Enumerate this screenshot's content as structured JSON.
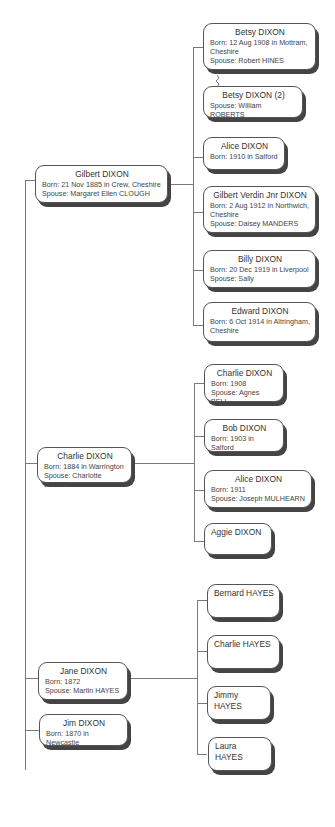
{
  "tree": {
    "parents": [
      {
        "name": "Gilbert DIXON",
        "details": "Born: 21 Nov 1885 in Crew, Cheshire\nSpouse: Margaret Ellen CLOUGH"
      },
      {
        "name": "Charlie DIXON",
        "details": "Born: 1884 in Warrington\nSpouse: Charlotte LOCKE"
      },
      {
        "name": "Jane DIXON",
        "details": "Born: 1872\nSpouse: Martin HAYES"
      },
      {
        "name": "Jim DIXON",
        "details": "Born: 1870 in Newcastle"
      }
    ],
    "gilbert_children": [
      {
        "name": "Betsy DIXON",
        "details": "Born: 12 Aug 1908 in Mottram,\n        Cheshire\nSpouse: Robert HINES"
      },
      {
        "name": "Betsy DIXON (2)",
        "details": "Spouse: William ROBERTS"
      },
      {
        "name": "Alice DIXON",
        "details": "Born: 1910 in Salford"
      },
      {
        "name": "Gilbert Verdin Jnr DIXON",
        "details": "Born: 2 Aug 1912 in Northwich,\n        Cheshire\nSpouse: Daisey MANDERS"
      },
      {
        "name": "Billy DIXON",
        "details": "Born: 20 Dec 1919 in Liverpool\nSpouse: Sally"
      },
      {
        "name": "Edward DIXON",
        "details": "Born: 6 Oct 1914 in Altringham,\n        Cheshire"
      }
    ],
    "charlie_children": [
      {
        "name": "Charlie DIXON",
        "details": "Born: 1908\nSpouse: Agnes BELL"
      },
      {
        "name": "Bob DIXON",
        "details": "Born: 1903 in Salford"
      },
      {
        "name": "Alice DIXON",
        "details": "Born: 1911\nSpouse: Joseph MULHEARN"
      },
      {
        "name": "Aggie DIXON",
        "details": ""
      }
    ],
    "jane_children": [
      {
        "name": "Bernard HAYES"
      },
      {
        "name": "Charlie HAYES"
      },
      {
        "name": "Jimmy HAYES"
      },
      {
        "name": "Laura HAYES"
      }
    ]
  }
}
